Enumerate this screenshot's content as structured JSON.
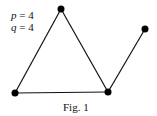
{
  "labels": {
    "p_var": "p",
    "p_eq": " = 4",
    "q_var": "q",
    "q_eq": " = 4",
    "caption": "Fig. 1"
  },
  "graph": {
    "vertices": [
      {
        "id": "top",
        "x": 61,
        "y": 9
      },
      {
        "id": "bottom-left",
        "x": 15,
        "y": 93
      },
      {
        "id": "bottom-right",
        "x": 108,
        "y": 92
      },
      {
        "id": "upper-right",
        "x": 145,
        "y": 29
      }
    ],
    "edges": [
      [
        "top",
        "bottom-left"
      ],
      [
        "top",
        "bottom-right"
      ],
      [
        "bottom-left",
        "bottom-right"
      ],
      [
        "bottom-right",
        "upper-right"
      ]
    ],
    "p": 4,
    "q": 4
  }
}
